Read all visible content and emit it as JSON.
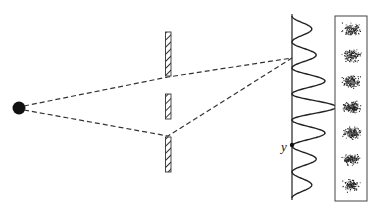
{
  "diagram": {
    "labels": {
      "point_label": "y"
    },
    "elements": {
      "source": "point source",
      "barrier": "barrier with two slits",
      "screen": "intensity pattern on screen",
      "detector": "detected particle pattern"
    },
    "pattern": {
      "fringe_count": 7,
      "relative_intensities": [
        0.45,
        0.55,
        0.75,
        1.0,
        0.75,
        0.55,
        0.45
      ]
    },
    "colors": {
      "ink": "#1a1a1a",
      "background": "#ffffff"
    }
  }
}
